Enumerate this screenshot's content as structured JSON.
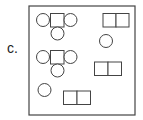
{
  "label": "c.",
  "colors": {
    "stroke": "#444444",
    "background": "#ffffff"
  },
  "frame": {
    "x": 29,
    "y": 6,
    "w": 106,
    "h": 109
  },
  "shapes": [
    {
      "type": "circle",
      "cx": 43,
      "cy": 20,
      "r": 6.5
    },
    {
      "type": "rect",
      "x": 50.5,
      "y": 13.5,
      "w": 13.5,
      "h": 13.5
    },
    {
      "type": "circle",
      "cx": 70.5,
      "cy": 20,
      "r": 6.5
    },
    {
      "type": "circle",
      "cx": 57.5,
      "cy": 33.5,
      "r": 6.5
    },
    {
      "type": "rect",
      "x": 103,
      "y": 13.5,
      "w": 13,
      "h": 13.5
    },
    {
      "type": "rect",
      "x": 116,
      "y": 13.5,
      "w": 13,
      "h": 13.5
    },
    {
      "type": "circle",
      "cx": 106,
      "cy": 41,
      "r": 6.5
    },
    {
      "type": "circle",
      "cx": 43,
      "cy": 57,
      "r": 6.5
    },
    {
      "type": "rect",
      "x": 50.5,
      "y": 50.5,
      "w": 13.5,
      "h": 13.5
    },
    {
      "type": "circle",
      "cx": 70.5,
      "cy": 57,
      "r": 6.5
    },
    {
      "type": "circle",
      "cx": 57.5,
      "cy": 70.5,
      "r": 6.5
    },
    {
      "type": "rect",
      "x": 94.5,
      "y": 62,
      "w": 13.5,
      "h": 13.5
    },
    {
      "type": "rect",
      "x": 108,
      "y": 62,
      "w": 13.5,
      "h": 13.5
    },
    {
      "type": "circle",
      "cx": 44.5,
      "cy": 90,
      "r": 6.5
    },
    {
      "type": "rect",
      "x": 63.5,
      "y": 91,
      "w": 13.5,
      "h": 13.5
    },
    {
      "type": "rect",
      "x": 77,
      "y": 91,
      "w": 13.5,
      "h": 13.5
    }
  ]
}
